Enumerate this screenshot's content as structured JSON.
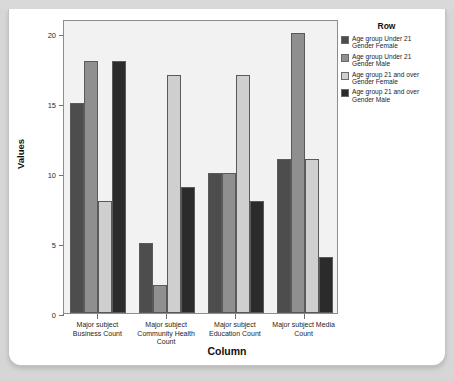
{
  "page": {
    "clipped_header": "",
    "background_color": "#d6d6d6",
    "card_color": "#ffffff"
  },
  "chart_data": {
    "type": "bar",
    "title": "",
    "xlabel": "Column",
    "ylabel": "Values",
    "ylim": [
      0,
      21
    ],
    "yticks": [
      0,
      5,
      10,
      15,
      20
    ],
    "grid": false,
    "plot_background": "#f2f2f2",
    "categories": [
      "Major subject Business Count",
      "Major subject Community Health Count",
      "Major subject Education Count",
      "Major subject Media Count"
    ],
    "series": [
      {
        "name": "Age group Under 21 Gender Female",
        "color": "#4d4d4d",
        "values": [
          15,
          5,
          10,
          11
        ]
      },
      {
        "name": "Age group Under 21 Gender Male",
        "color": "#8f8f8f",
        "values": [
          18,
          2,
          10,
          20
        ]
      },
      {
        "name": "Age group 21 and over Gender Female",
        "color": "#cfcfcf",
        "values": [
          8,
          17,
          17,
          11
        ]
      },
      {
        "name": "Age group 21 and over Gender Male",
        "color": "#2b2b2b",
        "values": [
          18,
          9,
          8,
          4
        ]
      }
    ],
    "legend": {
      "title": "Row",
      "position": "right",
      "entries": [
        {
          "label_line1": "Age group Under 21",
          "label_line2": "Gender Female",
          "color": "#4d4d4d"
        },
        {
          "label_line1": "Age group Under 21",
          "label_line2": "Gender Male",
          "color": "#8f8f8f"
        },
        {
          "label_line1": "Age group 21 and over",
          "label_line2": "Gender Female",
          "color": "#cfcfcf"
        },
        {
          "label_line1": "Age group 21 and over",
          "label_line2": "Gender Male",
          "color": "#2b2b2b"
        }
      ]
    }
  }
}
